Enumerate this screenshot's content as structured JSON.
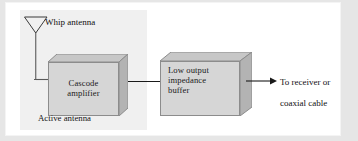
{
  "figure": {
    "background_color": "#e6e6e6",
    "page_color": "#ffffff"
  },
  "enclosure": {
    "name": "active-antenna-enclosure",
    "label": "Active antenna",
    "fill_color": "#f0f0f0"
  },
  "antenna": {
    "name": "whip-antenna",
    "label": "Whip antenna",
    "icon": "triangle-antenna-icon"
  },
  "blocks": [
    {
      "id": "cascode-amplifier",
      "label_line1": "Cascode",
      "label_line2": "amplifier",
      "face_color": "#d6d6d6",
      "top_color": "#c4c4c4",
      "side_color": "#b0b0b0",
      "stroke_color": "#8c8c8c"
    },
    {
      "id": "low-output-impedance-buffer",
      "label_line1": "Low output",
      "label_line2": "impedance",
      "label_line3": "buffer",
      "face_color": "#d6d6d6",
      "top_color": "#c4c4c4",
      "side_color": "#b0b0b0",
      "stroke_color": "#8c8c8c"
    }
  ],
  "connections": {
    "antenna_to_amplifier": "wire",
    "amplifier_to_buffer": "wire",
    "buffer_to_output": "arrow"
  },
  "output": {
    "name": "output-destination",
    "label_line1": "To receiver or",
    "label_line2": "coaxial cable"
  }
}
